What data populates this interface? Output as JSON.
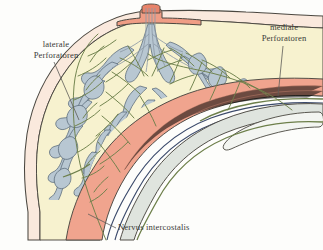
{
  "figure": {
    "background_color": "#fdfdfb"
  },
  "labels": {
    "lateral": {
      "text": "laterale\nPerforatoren",
      "name": "laterale Perforatoren"
    },
    "medial": {
      "text": "mediale\nPerforatoren",
      "name": "mediale Perforatoren"
    },
    "nerve": {
      "text": "Nervus intercostalis",
      "name": "Nervus intercostalis"
    }
  },
  "anatomy": {
    "skin": {
      "label": "skin",
      "color": "#fae9dd"
    },
    "fat": {
      "label": "subcutaneous fat",
      "color": "#f7f2cf"
    },
    "gland": {
      "label": "glandular lobules",
      "color": "#b8c7d2"
    },
    "nipple": {
      "label": "nipple and areola",
      "color": "#ef9d85"
    },
    "muscle": {
      "label": "pectoral muscle",
      "color": "#f0a48e"
    },
    "rib": {
      "label": "rib",
      "color": "#dfe4de"
    },
    "vessel_dark": {
      "label": "intercostal vessels",
      "color": "#3b4a6b"
    },
    "nerve_line": {
      "label": "nerve and perforator branches",
      "color": "#6d7f4a"
    },
    "outline": {
      "label": "ink outline",
      "color": "#4a4740"
    }
  },
  "colors": {
    "accent_green": "#6d7f4a",
    "accent_salmon": "#f0a48e",
    "accent_blue_grey": "#b8c7d2",
    "accent_cream": "#f7f2cf",
    "leader_line": "#5d5c58",
    "text": "#3a3a38"
  }
}
